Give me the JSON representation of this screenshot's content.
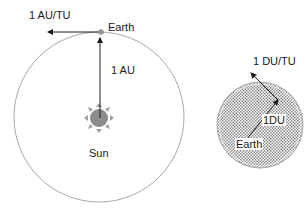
{
  "diagram": {
    "heliocentric": {
      "orbit_label": "Earth",
      "velocity_label": "1 AU/TU",
      "radius_label": "1 AU",
      "center_body_label": "Sun"
    },
    "geocentric": {
      "velocity_label": "1 DU/TU",
      "radius_label": "1DU",
      "center_body_label": "Earth"
    },
    "colors": {
      "orbit_stroke": "#a8a8a8",
      "sun_fill": "#8c8c8c",
      "arrow": "#1a1a1a",
      "earth_hatch": "#9a9a9a"
    }
  }
}
